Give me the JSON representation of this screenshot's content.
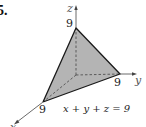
{
  "problem_number": "5.",
  "axes": {
    "x_label": "x",
    "y_label": "y",
    "z_label": "z"
  },
  "intercepts": {
    "x": "9",
    "y": "9",
    "z": "9"
  },
  "equation": "x + y + z = 9",
  "colors": {
    "face_fill": "#b4b4b4",
    "edge": "#1a1a1a",
    "axis": "#444444",
    "hidden_edge": "#444444"
  }
}
